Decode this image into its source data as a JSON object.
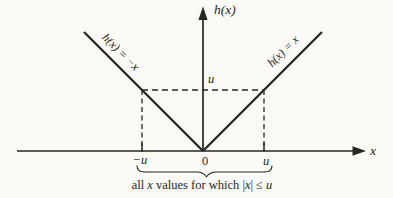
{
  "colors": {
    "background": "#fbfaf7",
    "ink": "#262624"
  },
  "axes": {
    "y_label": "h(x)",
    "x_label": "x",
    "origin_label": "0"
  },
  "marks": {
    "y_u_label": "u",
    "x_neg_u_label": "−u",
    "x_u_label": "u"
  },
  "lines": {
    "left_arm_label": "h(x) = −x",
    "right_arm_label": "h(x) = x"
  },
  "caption": {
    "p1": "all ",
    "p2": "x",
    "p3": " values for which |",
    "p4": "x",
    "p5": "| ≤ ",
    "p6": "u"
  }
}
